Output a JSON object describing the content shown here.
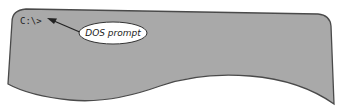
{
  "screen": {
    "prompt": "C:\\>",
    "background_color": "#a9a9a9",
    "outline_color": "#4a4a4a"
  },
  "callout": {
    "label": "DOS prompt",
    "fill": "#ffffff",
    "stroke": "#333333"
  }
}
